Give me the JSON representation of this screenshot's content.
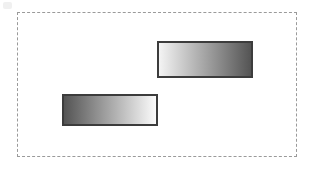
{
  "figure": {
    "background_color": "#ffffff",
    "width": 312,
    "height": 169
  },
  "frame": {
    "name": "dashed-bounding-frame",
    "border_style": "dashed",
    "border_color": "#9a9a9a",
    "border_width_px": 1,
    "x": 17,
    "y": 12,
    "width": 280,
    "height": 145
  },
  "shapes": [
    {
      "id": "rect-top",
      "label": "upper-right rectangle",
      "x": 157,
      "y": 41,
      "width": 96,
      "height": 37,
      "border_color": "#3c3c3c",
      "border_width_px": 2,
      "fill_type": "linear-gradient",
      "gradient_direction": "left-to-right",
      "gradient_from": "#f4f4f4",
      "gradient_to": "#545454"
    },
    {
      "id": "rect-bottom",
      "label": "lower-left rectangle",
      "x": 62,
      "y": 94,
      "width": 96,
      "height": 32,
      "border_color": "#3c3c3c",
      "border_width_px": 2,
      "fill_type": "linear-gradient",
      "gradient_direction": "left-to-right",
      "gradient_from": "#545454",
      "gradient_to": "#fbfbfb"
    }
  ],
  "artifact": {
    "name": "corner-scan-artifact",
    "color": "#f0f0f0"
  }
}
